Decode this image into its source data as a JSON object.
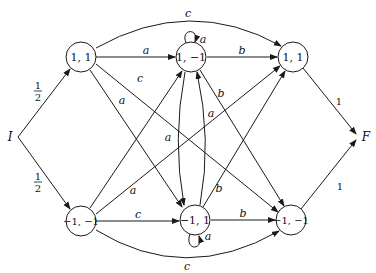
{
  "diagram": {
    "type": "weighted automaton",
    "initial": {
      "label": "I"
    },
    "final": {
      "label": "F"
    },
    "nodes": [
      {
        "id": "n1",
        "label": "1, 1"
      },
      {
        "id": "n2",
        "label": "1, −1"
      },
      {
        "id": "n3",
        "label": "1, 1"
      },
      {
        "id": "n4",
        "label": "−1, −1"
      },
      {
        "id": "n5",
        "label": "−1, 1"
      },
      {
        "id": "n6",
        "label": "−1, −1"
      }
    ],
    "initial_weights": {
      "top": "1",
      "top_den": "2",
      "bottom": "1",
      "bottom_den": "2"
    },
    "final_weights": {
      "top": "1",
      "bottom": "1"
    },
    "edges": [
      {
        "from": "n1",
        "to": "n2",
        "label": "a"
      },
      {
        "from": "n1",
        "to": "n3",
        "label": "c"
      },
      {
        "from": "n1",
        "to": "n5",
        "label": "a"
      },
      {
        "from": "n1",
        "to": "n6",
        "label": "c"
      },
      {
        "from": "n2",
        "to": "n2",
        "label": "a"
      },
      {
        "from": "n2",
        "to": "n3",
        "label": "b"
      },
      {
        "from": "n2",
        "to": "n5",
        "label": "a"
      },
      {
        "from": "n2",
        "to": "n6",
        "label": "b"
      },
      {
        "from": "n4",
        "to": "n2",
        "label": "a"
      },
      {
        "from": "n4",
        "to": "n3",
        "label": "c"
      },
      {
        "from": "n4",
        "to": "n5",
        "label": "a"
      },
      {
        "from": "n4",
        "to": "n6",
        "label": "c"
      },
      {
        "from": "n5",
        "to": "n2",
        "label": "a"
      },
      {
        "from": "n5",
        "to": "n3",
        "label": "b"
      },
      {
        "from": "n5",
        "to": "n5",
        "label": "a"
      },
      {
        "from": "n5",
        "to": "n6",
        "label": "b"
      }
    ]
  }
}
